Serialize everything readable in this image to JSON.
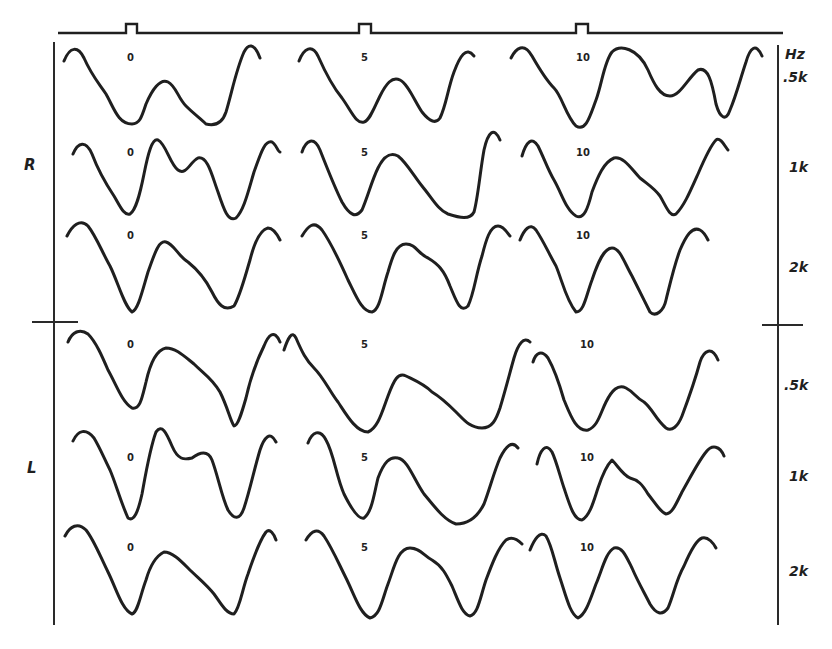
{
  "figure": {
    "stimulus_marker": {
      "line": {
        "x1": 58,
        "x2": 783,
        "y": 33
      },
      "pulses": [
        {
          "x": 126,
          "w": 11,
          "h": 9
        },
        {
          "x": 359,
          "w": 12,
          "h": 9
        },
        {
          "x": 576,
          "w": 12,
          "h": 9
        }
      ]
    },
    "ear_labels": [
      {
        "id": "R",
        "text": "R",
        "x": 24,
        "y": 156
      },
      {
        "id": "L",
        "text": "L",
        "x": 27,
        "y": 459
      }
    ],
    "unit_label": {
      "text": "Hz",
      "x": 785,
      "y": 46
    },
    "frequency_labels": [
      {
        "text": ".5k",
        "x": 783,
        "y": 69,
        "ear": "R"
      },
      {
        "text": "1k",
        "x": 789,
        "y": 159,
        "ear": "R"
      },
      {
        "text": "2k",
        "x": 789,
        "y": 259,
        "ear": "R"
      },
      {
        "text": ".5k",
        "x": 784,
        "y": 377,
        "ear": "L"
      },
      {
        "text": "1k",
        "x": 789,
        "y": 468,
        "ear": "L"
      },
      {
        "text": "2k",
        "x": 789,
        "y": 563,
        "ear": "L"
      }
    ],
    "column_labels": [
      "0",
      "5",
      "10"
    ],
    "rows": [
      {
        "ear": "R",
        "freq": ".5k",
        "labels": [
          {
            "text": "0",
            "x": 127,
            "y": 52
          },
          {
            "text": "5",
            "x": 361,
            "y": 52
          },
          {
            "text": "10",
            "x": 576,
            "y": 52
          }
        ],
        "paths": [
          "M64,61 C70,46 78,46 84,58 C92,76 98,82 106,94 C114,108 118,124 132,124 C140,124 142,116 146,104 C152,90 160,78 168,82 C176,86 178,98 186,106 C194,114 200,118 206,124 C214,126 222,124 226,112 C232,92 236,70 244,52 C248,44 254,42 260,58",
          "M299,61 C304,48 312,44 318,56 C326,74 332,86 342,98 C352,112 356,124 364,122 C370,120 374,108 380,96 C386,84 392,76 400,80 C408,84 414,100 422,112 C430,122 436,124 440,118 C446,106 448,88 454,72 C460,56 466,46 474,56",
          "M511,58 C516,48 524,42 532,56 C540,70 546,80 554,88 C562,96 566,116 576,126 C586,132 590,116 596,100 C602,84 604,62 612,52 C620,44 638,48 648,70 C654,84 660,96 670,96 C680,96 688,78 698,70 C708,66 712,82 716,104 C720,118 726,122 730,110 C736,96 740,80 746,62 C750,48 756,42 762,56"
        ]
      },
      {
        "ear": "R",
        "freq": "1k",
        "labels": [
          {
            "text": "0",
            "x": 127,
            "y": 147
          },
          {
            "text": "5",
            "x": 361,
            "y": 147
          },
          {
            "text": "10",
            "x": 576,
            "y": 147
          }
        ],
        "paths": [
          "M73,154 C78,142 86,140 92,154 C98,170 106,184 114,196 C120,206 124,216 130,214 C136,210 140,194 144,174 C148,154 152,138 158,140 C166,144 170,164 178,170 C186,176 190,162 198,158 C208,156 212,176 218,192 C224,210 228,222 236,218 C244,210 248,192 254,172 C260,156 264,140 272,142 C276,144 278,152 280,152",
          "M302,152 C306,140 314,136 320,150 C328,170 334,186 342,202 C350,216 356,218 362,210 C368,196 372,180 378,168 C384,156 390,152 398,156 C406,162 414,176 422,186 C432,198 438,210 448,214 C460,218 470,220 474,212 C478,198 480,172 484,150 C488,132 494,126 500,140",
          "M522,156 C526,142 532,136 538,146 C544,158 548,170 554,180 C562,194 566,210 576,216 C584,220 588,208 592,192 C598,176 604,162 614,158 C624,156 632,170 640,178 C650,186 654,188 660,196 C666,206 670,218 676,214 C684,206 690,192 698,174 C704,160 710,146 716,140 C720,136 726,148 728,150"
        ]
      },
      {
        "ear": "R",
        "freq": "2k",
        "labels": [
          {
            "text": "0",
            "x": 127,
            "y": 230
          },
          {
            "text": "5",
            "x": 361,
            "y": 230
          },
          {
            "text": "10",
            "x": 576,
            "y": 230
          }
        ],
        "paths": [
          "M67,236 C72,226 80,218 88,226 C96,236 102,252 110,266 C118,282 124,306 132,312 C138,310 142,292 148,272 C154,256 158,240 166,242 C174,244 178,256 188,262 C198,270 206,280 212,292 C218,304 224,312 234,306 C240,296 244,280 250,260 C254,244 260,230 268,228 C274,228 278,236 280,240",
          "M302,236 C308,226 314,220 322,230 C332,244 340,262 348,280 C356,296 362,312 372,312 C380,310 382,290 388,272 C392,258 396,244 406,244 C416,244 418,254 428,258 C438,264 444,270 450,286 C456,300 460,314 468,306 C474,294 476,274 482,256 C486,240 490,226 498,226 C504,226 508,234 510,236",
          "M520,240 C524,230 530,222 536,230 C544,242 548,252 556,266 C562,280 566,300 576,312 C584,312 586,296 592,280 C598,262 604,248 612,248 C620,248 624,262 632,276 C640,292 644,300 650,312 C656,318 664,310 666,300 C670,284 674,266 680,250 C686,236 692,226 700,230 C704,232 706,236 708,240"
        ]
      },
      {
        "ear": "L",
        "freq": ".5k",
        "labels": [
          {
            "text": "0",
            "x": 127,
            "y": 339
          },
          {
            "text": "5",
            "x": 361,
            "y": 339
          },
          {
            "text": "10",
            "x": 580,
            "y": 339
          }
        ],
        "paths": [
          "M68,342 C72,332 80,328 88,334 C96,342 102,356 108,370 C116,384 122,402 132,408 C140,410 142,398 146,382 C150,364 156,350 166,348 C176,348 184,356 194,364 C204,374 212,378 220,392 C228,408 230,420 234,426 C238,426 242,412 246,398 C250,380 256,362 264,346 C268,336 274,328 280,342",
          "M284,350 C288,338 292,330 296,338 C302,352 306,360 314,368 C324,378 330,392 338,402 C346,414 356,432 368,432 C378,428 382,412 388,396 C394,380 398,372 406,376 C414,380 424,384 432,392 C442,398 448,404 456,412 C464,420 470,428 482,428 C492,428 496,420 500,408 C506,388 510,372 514,358 C518,344 524,336 530,342",
          "M533,362 C536,352 542,350 548,358 C556,372 560,386 564,400 C570,414 576,432 588,430 C598,426 600,414 606,402 C612,390 618,384 626,388 C634,392 636,398 644,402 C652,408 656,420 666,428 C672,432 678,426 682,416 C688,400 694,384 700,362 C704,350 712,346 718,360"
        ]
      },
      {
        "ear": "L",
        "freq": "1k",
        "labels": [
          {
            "text": "0",
            "x": 127,
            "y": 452
          },
          {
            "text": "5",
            "x": 361,
            "y": 452
          },
          {
            "text": "10",
            "x": 580,
            "y": 452
          }
        ],
        "paths": [
          "M73,441 C78,430 86,428 94,438 C100,448 104,458 110,470 C116,484 120,500 128,518 C134,522 138,512 142,494 C146,472 150,448 156,432 C162,424 166,432 172,446 C178,460 184,460 192,458 C200,452 208,450 212,460 C218,476 222,498 228,510 C234,520 240,520 244,508 C250,490 254,470 260,450 C264,438 270,430 276,442",
          "M308,443 C312,432 320,428 326,440 C334,454 336,476 344,494 C350,506 358,520 364,518 C372,512 374,494 378,478 C384,462 390,456 398,458 C408,460 414,480 424,494 C434,506 444,520 456,524 C466,524 476,520 484,504 C490,488 494,472 500,458 C506,446 512,440 518,448",
          "M537,464 C540,450 546,442 552,452 C556,460 560,476 564,488 C570,506 574,520 582,520 C590,516 594,500 598,488 C602,476 608,464 612,460 C618,466 622,474 630,478 C638,480 642,484 648,494 C656,504 660,512 666,514 C672,514 676,504 682,492 C690,478 698,462 706,452 C712,444 720,446 724,456"
        ]
      },
      {
        "ear": "L",
        "freq": "2k",
        "labels": [
          {
            "text": "0",
            "x": 127,
            "y": 542
          },
          {
            "text": "5",
            "x": 361,
            "y": 542
          },
          {
            "text": "10",
            "x": 580,
            "y": 542
          }
        ],
        "paths": [
          "M65,536 C70,526 78,522 86,530 C94,540 100,556 108,572 C116,588 122,610 132,614 C138,612 140,596 146,580 C150,566 156,556 164,552 C172,552 180,560 188,568 C198,578 206,584 214,594 C220,602 226,614 234,614 C240,608 242,590 248,574 C254,556 260,540 266,532 C270,528 274,534 276,540",
          "M306,540 C312,530 318,528 324,536 C332,548 338,562 346,578 C354,594 360,614 370,618 C380,616 382,600 388,584 C394,568 398,548 410,548 C420,548 424,556 432,560 C442,566 446,574 452,586 C458,600 462,614 470,616 C478,614 480,598 486,580 C492,564 498,548 506,540 C512,536 518,540 522,544",
          "M530,550 C534,540 540,530 546,536 C552,546 554,560 560,578 C566,596 570,614 578,618 C586,614 590,600 596,584 C602,570 606,552 614,548 C622,546 626,556 632,568 C638,582 644,592 650,604 C656,614 662,616 668,608 C674,594 676,580 684,566 C690,552 696,540 702,538 C708,536 714,544 716,548"
        ]
      }
    ],
    "left_axis": {
      "x": 54,
      "y1": 42,
      "y2": 625,
      "cross_y": 322,
      "cross_x1": 32,
      "cross_x2": 78
    },
    "right_axis": {
      "x": 778,
      "y1": 45,
      "y2": 625,
      "cross_y": 325,
      "cross_x1": 762,
      "cross_x2": 803
    }
  }
}
